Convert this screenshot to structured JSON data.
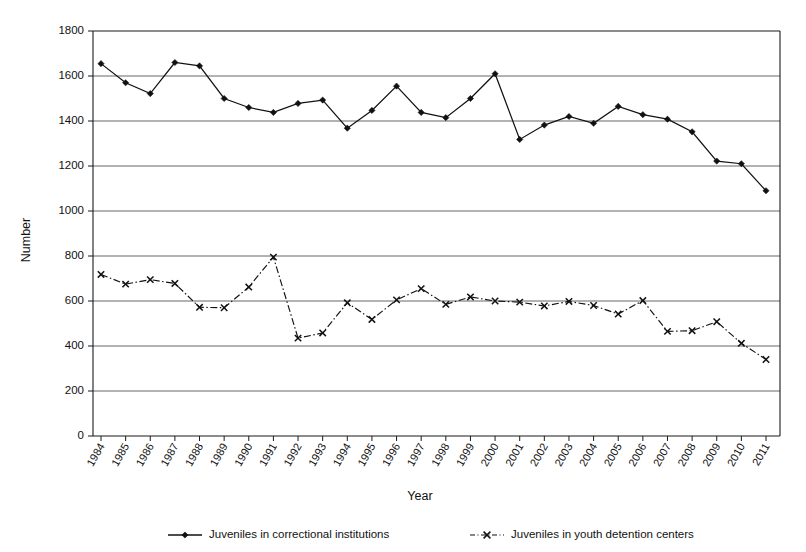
{
  "chart_data": {
    "type": "line",
    "title": "",
    "xlabel": "Year",
    "ylabel": "Number",
    "ylim": [
      0,
      1800
    ],
    "ytick_step": 200,
    "yticks": [
      0,
      200,
      400,
      600,
      800,
      1000,
      1200,
      1400,
      1600,
      1800
    ],
    "grid": "horizontal",
    "legend_position": "bottom",
    "categories": [
      "1984",
      "1985",
      "1986",
      "1987",
      "1988",
      "1989",
      "1990",
      "1991",
      "1992",
      "1993",
      "1994",
      "1995",
      "1996",
      "1997",
      "1998",
      "1999",
      "2000",
      "2001",
      "2002",
      "2003",
      "2004",
      "2005",
      "2006",
      "2007",
      "2008",
      "2009",
      "2010",
      "2011"
    ],
    "series": [
      {
        "name": "Juveniles in correctional institutions",
        "marker": "diamond",
        "line_style": "solid",
        "color": "#111111",
        "values": [
          1655,
          1570,
          1522,
          1660,
          1645,
          1500,
          1460,
          1438,
          1478,
          1493,
          1368,
          1447,
          1555,
          1438,
          1415,
          1500,
          1610,
          1318,
          1382,
          1420,
          1390,
          1465,
          1428,
          1408,
          1352,
          1222,
          1210,
          1090
        ]
      },
      {
        "name": "Juveniles in youth detention centers",
        "marker": "x",
        "line_style": "dash-dot",
        "color": "#111111",
        "values": [
          718,
          675,
          695,
          678,
          572,
          570,
          662,
          795,
          435,
          458,
          592,
          518,
          605,
          655,
          585,
          618,
          600,
          595,
          578,
          598,
          580,
          542,
          602,
          465,
          468,
          508,
          412,
          340
        ]
      }
    ]
  },
  "legend": {
    "items": [
      {
        "label": "Juveniles in correctional institutions",
        "marker": "diamond-marker-icon",
        "style": "solid"
      },
      {
        "label": "Juveniles in youth detention centers",
        "marker": "x-marker-icon",
        "style": "dash-dot"
      }
    ]
  }
}
